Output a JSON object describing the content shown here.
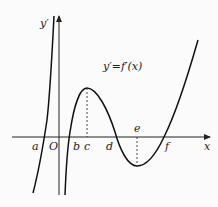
{
  "diagram": {
    "function_label": "y′=f′(x)",
    "y_axis_label": "y′",
    "x_axis_label": "x",
    "origin_label": "O",
    "points": [
      {
        "label": "a",
        "role": "zero of f′ (left branch)"
      },
      {
        "label": "b",
        "role": "zero of f′"
      },
      {
        "label": "c",
        "role": "local maximum of f′"
      },
      {
        "label": "d",
        "role": "zero of f′"
      },
      {
        "label": "e",
        "role": "local minimum of f′"
      },
      {
        "label": "f",
        "role": "zero of f′"
      }
    ],
    "colors": {
      "background": "#fbfbfb",
      "stroke": "#111111"
    }
  }
}
